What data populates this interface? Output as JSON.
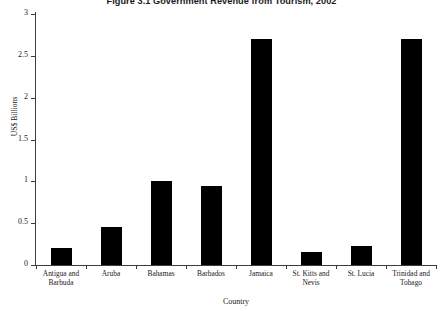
{
  "chart_data": {
    "type": "bar",
    "title": "Figure 3.1  Government Revenue from Tourism, 2002",
    "xlabel": "Country",
    "ylabel": "US$ Billions",
    "categories": [
      "Antigua and Barbuda",
      "Aruba",
      "Bahamas",
      "Barbados",
      "Jamaica",
      "St. Kitts and Nevis",
      "St. Lucia",
      "Trinidad and Tobago"
    ],
    "values": [
      0.2,
      0.45,
      1.0,
      0.95,
      2.7,
      0.15,
      0.23,
      2.7
    ],
    "ylim": [
      0,
      3
    ],
    "yticks": [
      0,
      0.5,
      1,
      1.5,
      2,
      2.5,
      3
    ],
    "ytick_labels": [
      "0",
      "0.5",
      "1",
      "1.5",
      "2",
      "2.5",
      "3"
    ],
    "grid": false,
    "legend": null,
    "bar_color": "#000000",
    "axis_color": "#3c3c3c",
    "background": "#ffffff"
  }
}
